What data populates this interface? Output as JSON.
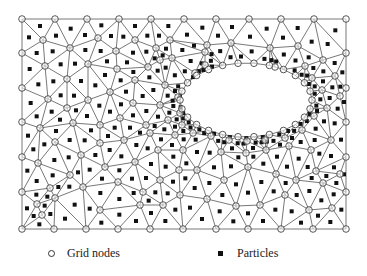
{
  "figure": {
    "domain": {
      "x0": 22,
      "y0": 19,
      "x1": 346,
      "y1": 229
    },
    "hole": {
      "cx": 246,
      "cy": 100,
      "rx": 66,
      "ry": 37
    },
    "colors": {
      "line": "#555555",
      "node": "#444444",
      "particle": "#111111",
      "background": "#ffffff"
    },
    "nodes": [
      [
        22,
        19
      ],
      [
        55,
        19
      ],
      [
        87,
        19
      ],
      [
        119,
        19
      ],
      [
        151,
        19
      ],
      [
        184,
        19
      ],
      [
        216,
        19
      ],
      [
        249,
        19
      ],
      [
        281,
        19
      ],
      [
        314,
        19
      ],
      [
        346,
        19
      ],
      [
        22,
        53
      ],
      [
        22,
        88
      ],
      [
        22,
        122
      ],
      [
        22,
        157
      ],
      [
        22,
        192
      ],
      [
        22,
        229
      ],
      [
        346,
        53
      ],
      [
        346,
        88
      ],
      [
        346,
        122
      ],
      [
        346,
        157
      ],
      [
        346,
        192
      ],
      [
        346,
        229
      ],
      [
        54,
        229
      ],
      [
        86,
        229
      ],
      [
        118,
        229
      ],
      [
        150,
        229
      ],
      [
        183,
        229
      ],
      [
        216,
        229
      ],
      [
        248,
        229
      ],
      [
        281,
        229
      ],
      [
        313,
        229
      ],
      [
        43,
        40
      ],
      [
        70,
        48
      ],
      [
        98,
        38
      ],
      [
        116,
        51
      ],
      [
        135,
        40
      ],
      [
        156,
        48
      ],
      [
        170,
        40
      ],
      [
        160,
        60
      ],
      [
        45,
        66
      ],
      [
        67,
        79
      ],
      [
        88,
        64
      ],
      [
        117,
        69
      ],
      [
        135,
        80
      ],
      [
        148,
        67
      ],
      [
        172,
        58
      ],
      [
        48,
        99
      ],
      [
        67,
        108
      ],
      [
        88,
        100
      ],
      [
        110,
        92
      ],
      [
        133,
        103
      ],
      [
        160,
        105
      ],
      [
        165,
        85
      ],
      [
        178,
        97
      ],
      [
        40,
        128
      ],
      [
        73,
        123
      ],
      [
        100,
        125
      ],
      [
        120,
        118
      ],
      [
        146,
        125
      ],
      [
        168,
        120
      ],
      [
        55,
        142
      ],
      [
        81,
        155
      ],
      [
        100,
        143
      ],
      [
        124,
        140
      ],
      [
        150,
        133
      ],
      [
        175,
        135
      ],
      [
        38,
        163
      ],
      [
        70,
        175
      ],
      [
        105,
        167
      ],
      [
        135,
        162
      ],
      [
        158,
        150
      ],
      [
        183,
        150
      ],
      [
        50,
        188
      ],
      [
        83,
        187
      ],
      [
        118,
        182
      ],
      [
        143,
        192
      ],
      [
        160,
        180
      ],
      [
        179,
        170
      ],
      [
        37,
        204
      ],
      [
        55,
        198
      ],
      [
        42,
        215
      ],
      [
        100,
        210
      ],
      [
        140,
        205
      ],
      [
        163,
        205
      ],
      [
        180,
        195
      ],
      [
        207,
        45
      ],
      [
        231,
        43
      ],
      [
        270,
        48
      ],
      [
        298,
        46
      ],
      [
        323,
        60
      ],
      [
        205,
        52
      ],
      [
        195,
        73
      ],
      [
        205,
        65
      ],
      [
        226,
        66
      ],
      [
        252,
        65
      ],
      [
        275,
        67
      ],
      [
        289,
        74
      ],
      [
        305,
        66
      ],
      [
        312,
        78
      ],
      [
        322,
        90
      ],
      [
        327,
        108
      ],
      [
        335,
        76
      ],
      [
        340,
        96
      ],
      [
        180,
        113
      ],
      [
        182,
        125
      ],
      [
        193,
        133
      ],
      [
        211,
        136
      ],
      [
        229,
        140
      ],
      [
        247,
        141
      ],
      [
        265,
        140
      ],
      [
        285,
        138
      ],
      [
        302,
        130
      ],
      [
        314,
        116
      ],
      [
        221,
        152
      ],
      [
        246,
        153
      ],
      [
        266,
        150
      ],
      [
        289,
        146
      ],
      [
        311,
        150
      ],
      [
        331,
        140
      ],
      [
        316,
        171
      ],
      [
        197,
        170
      ],
      [
        224,
        180
      ],
      [
        248,
        167
      ],
      [
        276,
        174
      ],
      [
        296,
        180
      ],
      [
        323,
        183
      ],
      [
        340,
        174
      ],
      [
        207,
        199
      ],
      [
        236,
        206
      ],
      [
        260,
        205
      ],
      [
        285,
        195
      ],
      [
        309,
        210
      ],
      [
        332,
        208
      ]
    ],
    "hole_boundary_count": 26
  },
  "legend": {
    "grid_nodes": {
      "symbol": "circle",
      "label": "Grid nodes"
    },
    "particles": {
      "symbol": "square",
      "label": "Particles"
    }
  }
}
